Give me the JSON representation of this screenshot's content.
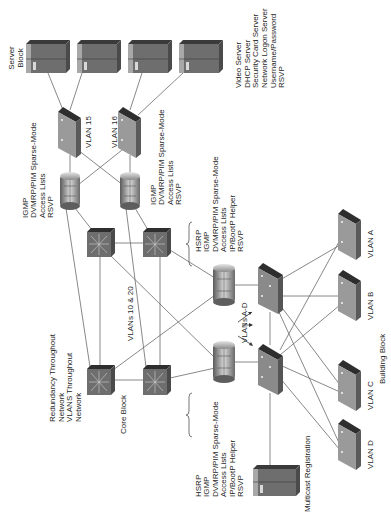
{
  "diagram": {
    "orientation": "rotated 90 degrees counter-clockwise",
    "colors": {
      "device_dark": "#4a4a4a",
      "device_mid": "#6e6e6e",
      "device_light": "#9a9a9a",
      "link": "#6a6a6a",
      "text": "#1e1e1e"
    },
    "server_block": {
      "label_line1": "Server",
      "label_line2": "Block",
      "server_count": 4,
      "services": [
        "Video Server",
        "DHCP Server",
        "Security Card Server",
        "Network Logon Server",
        "Username/Password",
        "RSVP"
      ]
    },
    "vlan_switches": {
      "vlan15": "VLAN 15",
      "vlan16": "VLAN 16"
    },
    "server_routers": {
      "left_features": [
        "IGMP",
        "DVMRP/PIM Sparse-Mode",
        "Access Lists",
        "RSVP"
      ],
      "right_features": [
        "IGMP",
        "DVMRP/PIM Sparse-Mode",
        "Access Lists",
        "RSVP"
      ]
    },
    "core_block": {
      "label": "Core Block",
      "vlans_label": "VLANs 10 & 20",
      "notes": [
        "Redundancy Throughout",
        "Network",
        "VLANS Throughout",
        "Network"
      ]
    },
    "building_routers": {
      "upper_features": [
        "HSRP",
        "IGMP",
        "DVMRP/PIM Sparse-Mode",
        "Access Lists",
        "IP/BootP Helper",
        "RSVP"
      ],
      "lower_features": [
        "HSRP",
        "IGMP",
        "DVMRP/PIM Sparse-Mode",
        "Access Lists",
        "IP/BootP Helper",
        "RSVP"
      ]
    },
    "building_block": {
      "label": "Building Block",
      "vlans_label": "VLANs A-D",
      "access_switches": [
        "VLAN A",
        "VLAN B",
        "VLAN C",
        "VLAN D"
      ]
    },
    "multicast": {
      "label": "Multicast Registration"
    }
  }
}
